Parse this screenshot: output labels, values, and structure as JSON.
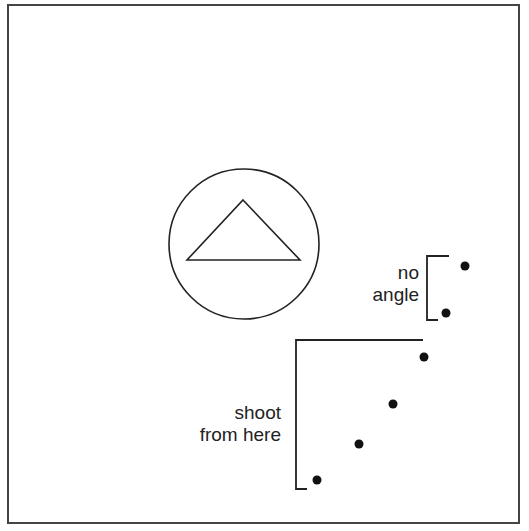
{
  "diagram": {
    "colors": {
      "ink": "#222222",
      "background": "#ffffff",
      "frame": "#444444"
    },
    "target": {
      "shape": "circle-with-triangle"
    },
    "labels": {
      "no_angle": {
        "line1": "no",
        "line2": "angle"
      },
      "shoot_from_here": {
        "line1": "shoot",
        "line2": "from here"
      }
    },
    "no_angle_points": [
      {
        "x": 465,
        "y": 266
      },
      {
        "x": 446,
        "y": 313
      }
    ],
    "shoot_points": [
      {
        "x": 424,
        "y": 357
      },
      {
        "x": 393,
        "y": 404
      },
      {
        "x": 359,
        "y": 444
      },
      {
        "x": 317,
        "y": 480
      }
    ]
  }
}
